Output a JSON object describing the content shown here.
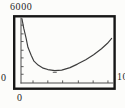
{
  "chart_data": {
    "type": "line",
    "title": "",
    "xlabel": "",
    "ylabel": "",
    "xlim": [
      0,
      10
    ],
    "ylim": [
      0,
      6000
    ],
    "labels": {
      "y_max": "6000",
      "y_min": "0",
      "x_min": "0",
      "x_max": "10"
    },
    "x": [
      0.1,
      0.3,
      0.55,
      0.75,
      1.1,
      1.4,
      1.85,
      2.4,
      2.9,
      3.65,
      4.4,
      5.3,
      6.1,
      7.0,
      7.85,
      8.7,
      9.35,
      9.8
    ],
    "y": [
      5900,
      5000,
      4100,
      3270,
      2550,
      2000,
      1640,
      1360,
      1230,
      1140,
      1180,
      1410,
      1730,
      2140,
      2590,
      3140,
      3640,
      4090
    ],
    "minimum_point": {
      "x": 3.65,
      "y": 1140
    },
    "x_ticks": [
      1.3,
      2.9,
      4.5,
      6.2,
      7.8,
      9.4
    ],
    "y_ticks": [
      800,
      1500,
      2300,
      3000,
      3800,
      4500,
      5300
    ],
    "grid": false,
    "legend": "none",
    "colors": {
      "frame": "#161616",
      "axis": "#4c4c4c",
      "curve": "#3c3c3c",
      "text": "#262626",
      "background": "#fcfcfa"
    }
  }
}
